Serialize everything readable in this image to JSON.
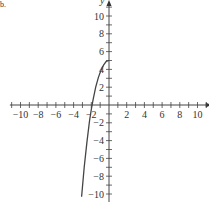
{
  "corner_label": "b.",
  "chart_data": {
    "type": "line",
    "title": "",
    "xlabel": "x",
    "ylabel": "y",
    "xlim": [
      -10,
      10
    ],
    "ylim": [
      -10,
      10
    ],
    "x_ticks": [
      -10,
      -8,
      -6,
      -4,
      -2,
      2,
      4,
      6,
      8,
      10
    ],
    "y_ticks": [
      -10,
      -8,
      -6,
      -4,
      -2,
      2,
      4,
      6,
      8,
      10
    ],
    "x_tick_labels": [
      "−10",
      "−8",
      "−6",
      "−4",
      "−2",
      "2",
      "4",
      "6",
      "8",
      "10"
    ],
    "y_tick_labels": [
      "−10",
      "−8",
      "−6",
      "−4",
      "−2",
      "2",
      "4",
      "6",
      "8",
      "10"
    ],
    "grid": false,
    "series": [
      {
        "name": "curve",
        "x": [
          -3.1,
          -2.8,
          -2.5,
          -2.2,
          -2.0,
          -1.8,
          -1.5,
          -1.2,
          -0.9,
          -0.6,
          -0.3,
          0
        ],
        "y": [
          -10.3,
          -7.0,
          -4.2,
          -1.8,
          -0.5,
          0.6,
          2.0,
          3.1,
          3.9,
          4.5,
          4.9,
          5.0
        ]
      }
    ]
  }
}
